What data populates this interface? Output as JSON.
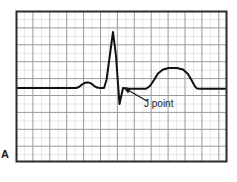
{
  "figure": {
    "panel_label": "A",
    "annotation_label": "J point",
    "colors": {
      "trace": "#111111",
      "frame": "#2b2b2b",
      "grid_major": "#9a9a9a",
      "grid_minor": "#e6e6e6",
      "background": "#ffffff",
      "text": "#1a1a1a"
    }
  },
  "chart_data": {
    "type": "line",
    "title": "",
    "subtitle": "",
    "xlabel": "",
    "ylabel": "",
    "grid": true,
    "legend_position": "none",
    "plot_box": {
      "x": 16,
      "y": 11,
      "width": 211,
      "height": 151
    },
    "grid_spec": {
      "major_spacing_px": 16.9,
      "minor_per_major": 2,
      "major_color": "#9a9a9a",
      "minor_color": "#e6e6e6"
    },
    "axis_ranges": {
      "xlim": [
        16,
        227
      ],
      "ylim": [
        11,
        162
      ]
    },
    "baseline_y": 88,
    "series": [
      {
        "name": "ECG tracing",
        "color": "#111111",
        "points": [
          [
            18,
            88
          ],
          [
            76,
            88
          ],
          [
            79,
            87
          ],
          [
            82,
            84.5
          ],
          [
            85,
            82.8
          ],
          [
            88,
            82.4
          ],
          [
            91,
            83.4
          ],
          [
            94,
            85.8
          ],
          [
            97,
            87.6
          ],
          [
            100,
            88
          ],
          [
            104,
            88
          ],
          [
            106.5,
            80
          ],
          [
            113,
            32
          ],
          [
            116,
            56
          ],
          [
            119.5,
            104
          ],
          [
            123,
            88
          ],
          [
            128,
            88.6
          ],
          [
            133,
            88.8
          ],
          [
            146,
            88.8
          ],
          [
            150,
            86
          ],
          [
            154,
            80
          ],
          [
            158,
            73.5
          ],
          [
            163,
            69.5
          ],
          [
            169,
            68
          ],
          [
            177,
            68
          ],
          [
            183,
            69.5
          ],
          [
            188,
            74
          ],
          [
            192,
            81
          ],
          [
            195,
            86.5
          ],
          [
            197,
            88.4
          ],
          [
            200,
            88.8
          ],
          [
            225,
            88.8
          ]
        ]
      }
    ],
    "annotations": [
      {
        "text": "J point",
        "text_x": 144,
        "text_y": 97,
        "arrow_tail_x": 147,
        "arrow_tail_y": 101,
        "arrow_head_x": 123.5,
        "arrow_head_y": 87.5
      }
    ]
  }
}
